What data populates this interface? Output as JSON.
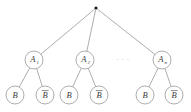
{
  "figure": {
    "type": "tree-diagram",
    "background_color": "#ffffff",
    "line_color": "#8a8a8a",
    "text_color": "#3a3a3a",
    "root_dot_color": "#1a1a1a",
    "width": 191,
    "height": 112
  },
  "root": {
    "label": "",
    "shape": "filled-dot",
    "x": 96,
    "y": 8,
    "radius": 1.6
  },
  "level1": {
    "y": 60,
    "radius": 9,
    "nodes": [
      {
        "main": "A",
        "sub": "1",
        "x": 34
      },
      {
        "main": "A",
        "sub": "2",
        "x": 85
      },
      {
        "main": "A",
        "sub": "n",
        "x": 162
      }
    ],
    "ellipsis": {
      "text": "· · ·",
      "x": 123,
      "y": 60
    }
  },
  "level2": {
    "y": 95,
    "radius": 9,
    "nodes": [
      {
        "main": "B",
        "overbar": false,
        "x": 15,
        "parent_index": 0
      },
      {
        "main": "B",
        "overbar": true,
        "x": 45,
        "parent_index": 0
      },
      {
        "main": "B",
        "overbar": false,
        "x": 69,
        "parent_index": 1
      },
      {
        "main": "B",
        "overbar": true,
        "x": 99,
        "parent_index": 1
      },
      {
        "main": "B",
        "overbar": false,
        "x": 145,
        "parent_index": 2
      },
      {
        "main": "B",
        "overbar": true,
        "x": 174,
        "parent_index": 2
      }
    ]
  }
}
